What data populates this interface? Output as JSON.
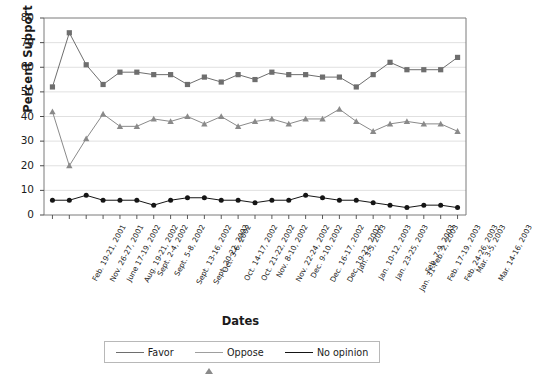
{
  "chart_data": {
    "type": "line",
    "title": "",
    "xlabel": "Dates",
    "ylabel": "Percent Support",
    "ylim": [
      0,
      80
    ],
    "yticks": [
      0,
      10,
      20,
      30,
      40,
      50,
      60,
      70,
      80
    ],
    "grid": true,
    "legend_position": "bottom",
    "categories": [
      "Feb. 19-21, 2001",
      "Nov. 26-27, 2001",
      "June 17-19, 2002",
      "Aug. 19-21, 2002",
      "Sept. 2-4, 2002",
      "Sept. 5-8, 2002",
      "Sept. 13-16, 2002",
      "Sept. 20-22, 2002",
      "Oct. 3-6, 2002",
      "Oct. 14-17, 2002",
      "Oct. 21-22, 2002",
      "Nov. 8-10, 2002",
      "Nov. 22-24, 2002",
      "Dec. 9-10, 2002",
      "Dec. 16-17, 2002",
      "Dec. 19-22, 2002",
      "Jan. 3-5, 2003",
      "Jan. 10-12, 2003",
      "Jan. 23-25, 2003",
      "Jan. 31-Feb. 2, 2003",
      "Feb. 7-9, 2003",
      "Feb. 17-19, 2003",
      "Feb. 24-26, 2003",
      "Mar. 3-5, 2003",
      "Mar. 14-16, 2003"
    ],
    "series": [
      {
        "name": "Favor",
        "marker": "square",
        "color": "#6e6e6e",
        "values": [
          52,
          74,
          61,
          53,
          58,
          58,
          57,
          57,
          53,
          56,
          54,
          57,
          55,
          58,
          57,
          57,
          56,
          56,
          52,
          57,
          62,
          59,
          59,
          59,
          64
        ]
      },
      {
        "name": "Oppose",
        "marker": "triangle",
        "color": "#8a8a8a",
        "values": [
          42,
          20,
          31,
          41,
          36,
          36,
          39,
          38,
          40,
          37,
          40,
          36,
          38,
          39,
          37,
          39,
          39,
          43,
          38,
          34,
          37,
          38,
          37,
          37,
          34
        ]
      },
      {
        "name": "No opinion",
        "marker": "circle",
        "color": "#151515",
        "values": [
          6,
          6,
          8,
          6,
          6,
          6,
          4,
          6,
          7,
          7,
          6,
          6,
          5,
          6,
          6,
          8,
          7,
          6,
          6,
          5,
          4,
          3,
          4,
          4,
          3
        ]
      }
    ]
  },
  "legend": {
    "items": [
      {
        "label": "Favor"
      },
      {
        "label": "Oppose"
      },
      {
        "label": "No opinion"
      }
    ]
  }
}
